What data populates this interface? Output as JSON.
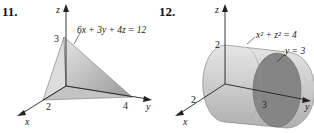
{
  "figures": [
    {
      "number": "11.",
      "equation": "6x + 3y + 4z = 12",
      "axes": {
        "x": "x",
        "y": "y",
        "z": "z"
      },
      "intercepts": {
        "x": "2",
        "y": "4",
        "z": "3"
      }
    },
    {
      "number": "12.",
      "equation": "x² + z² = 4",
      "plane_label": "y = 3",
      "axes": {
        "x": "x",
        "y": "y",
        "z": "z"
      },
      "ticks": {
        "z": "2",
        "x": "2",
        "y": "3"
      }
    }
  ]
}
